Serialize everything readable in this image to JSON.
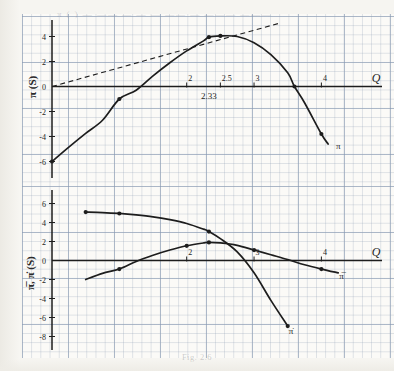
{
  "figure": {
    "caption": "Fig. 2.6",
    "bleed_through_text": "π ( ) — —— — — — —— — ——— ———"
  },
  "top_chart": {
    "ylabel": "π (S)",
    "xlabel": "Q",
    "curve_label": "π",
    "xticks": [
      "2",
      "2.5",
      "3",
      "4"
    ],
    "xtick_values": [
      2,
      2.5,
      3,
      4
    ],
    "yticks": [
      "4",
      "2",
      "0",
      "-2",
      "-4",
      "-6"
    ],
    "ytick_values": [
      4,
      2,
      0,
      -2,
      -4,
      -6
    ],
    "annotation": "2.33"
  },
  "bottom_chart": {
    "ylabel": "π̅, π̇ (S)",
    "xlabel": "Q",
    "curve_label_avg": "π̅",
    "curve_label_marg": "π̇",
    "xticks": [
      "2",
      "3",
      "4"
    ],
    "xtick_values": [
      2,
      3,
      4
    ],
    "yticks": [
      "6",
      "4",
      "2",
      "0",
      "-2",
      "-4",
      "-6",
      "-8"
    ],
    "ytick_values": [
      6,
      4,
      2,
      0,
      -2,
      -4,
      -6,
      -8
    ]
  },
  "chart_data": [
    {
      "type": "line",
      "id": "total-profit",
      "title": "",
      "xlabel": "Q",
      "ylabel": "π (S)",
      "xlim": [
        0,
        4.9
      ],
      "ylim": [
        -7,
        5
      ],
      "grid": true,
      "legend": "none",
      "annotations": [
        {
          "text": "2.33",
          "x": 2.33,
          "y": -1.0
        },
        {
          "text": "π",
          "x": 4.25,
          "y": -5.0
        }
      ],
      "series": [
        {
          "name": "π",
          "style": "solid",
          "x": [
            0,
            0.25,
            0.5,
            0.75,
            1.0,
            1.25,
            1.5,
            1.75,
            2.0,
            2.25,
            2.33,
            2.5,
            2.75,
            3.0,
            3.25,
            3.5,
            3.6,
            3.75,
            4.0,
            4.1
          ],
          "y": [
            -6.0,
            -4.85,
            -3.75,
            -2.7,
            -1.0,
            -0.3,
            0.85,
            1.9,
            2.85,
            3.65,
            3.95,
            4.05,
            4.0,
            3.5,
            2.55,
            1.1,
            0.0,
            -1.3,
            -3.8,
            -4.6
          ],
          "markers": [
            {
              "x": 0.0,
              "y": -6.0
            },
            {
              "x": 1.0,
              "y": -1.0
            },
            {
              "x": 2.33,
              "y": 3.95
            },
            {
              "x": 2.5,
              "y": 4.05
            },
            {
              "x": 3.6,
              "y": 0.0
            },
            {
              "x": 4.0,
              "y": -3.8
            }
          ]
        },
        {
          "name": "tangent-ray",
          "style": "dashed",
          "x": [
            0,
            3.4
          ],
          "y": [
            0,
            5.1
          ],
          "markers": []
        }
      ]
    },
    {
      "type": "line",
      "id": "average-and-marginal-profit",
      "title": "",
      "xlabel": "Q",
      "ylabel": "π̅, π̇ (S)",
      "xlim": [
        0,
        4.9
      ],
      "ylim": [
        -9,
        7
      ],
      "grid": true,
      "legend": "none",
      "annotations": [
        {
          "text": "π̅",
          "x": 4.3,
          "y": -1.9
        },
        {
          "text": "π̇",
          "x": 3.55,
          "y": -7.7
        }
      ],
      "series": [
        {
          "name": "π̇",
          "style": "solid",
          "x": [
            0.5,
            0.75,
            1.0,
            1.25,
            1.5,
            1.75,
            2.0,
            2.25,
            2.33,
            2.5,
            2.75,
            3.0,
            3.25,
            3.5
          ],
          "y": [
            5.1,
            5.05,
            4.95,
            4.8,
            4.6,
            4.3,
            3.9,
            3.3,
            3.05,
            2.3,
            0.9,
            -1.3,
            -4.2,
            -6.9
          ],
          "markers": [
            {
              "x": 0.5,
              "y": 5.1
            },
            {
              "x": 1.0,
              "y": 4.95
            },
            {
              "x": 2.33,
              "y": 3.05
            },
            {
              "x": 3.5,
              "y": -6.9
            }
          ]
        },
        {
          "name": "π̅",
          "style": "solid",
          "x": [
            0.5,
            0.75,
            1.0,
            1.25,
            1.5,
            1.75,
            2.0,
            2.25,
            2.33,
            2.5,
            2.75,
            3.0,
            3.25,
            3.5,
            3.75,
            4.0,
            4.25
          ],
          "y": [
            -2.0,
            -1.35,
            -0.9,
            -0.1,
            0.55,
            1.1,
            1.55,
            1.85,
            1.9,
            1.85,
            1.6,
            1.1,
            0.6,
            0.1,
            -0.45,
            -0.9,
            -1.3
          ],
          "markers": [
            {
              "x": 1.0,
              "y": -0.9
            },
            {
              "x": 2.0,
              "y": 1.55
            },
            {
              "x": 2.33,
              "y": 1.9
            },
            {
              "x": 3.0,
              "y": 1.1
            },
            {
              "x": 4.0,
              "y": -0.9
            }
          ]
        }
      ]
    }
  ]
}
